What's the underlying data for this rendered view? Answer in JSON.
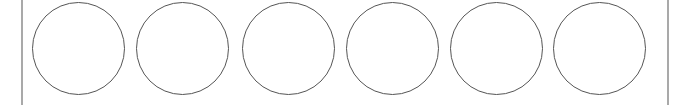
{
  "container": {
    "border_color": "#a9a9a9"
  },
  "circles": {
    "count": 6,
    "stroke_color": "#555555",
    "fill_color": "#ffffff",
    "items": [
      {
        "index": 1,
        "left": 32
      },
      {
        "index": 2,
        "left": 136
      },
      {
        "index": 3,
        "left": 242
      },
      {
        "index": 4,
        "left": 346
      },
      {
        "index": 5,
        "left": 450
      },
      {
        "index": 6,
        "left": 553
      }
    ]
  }
}
